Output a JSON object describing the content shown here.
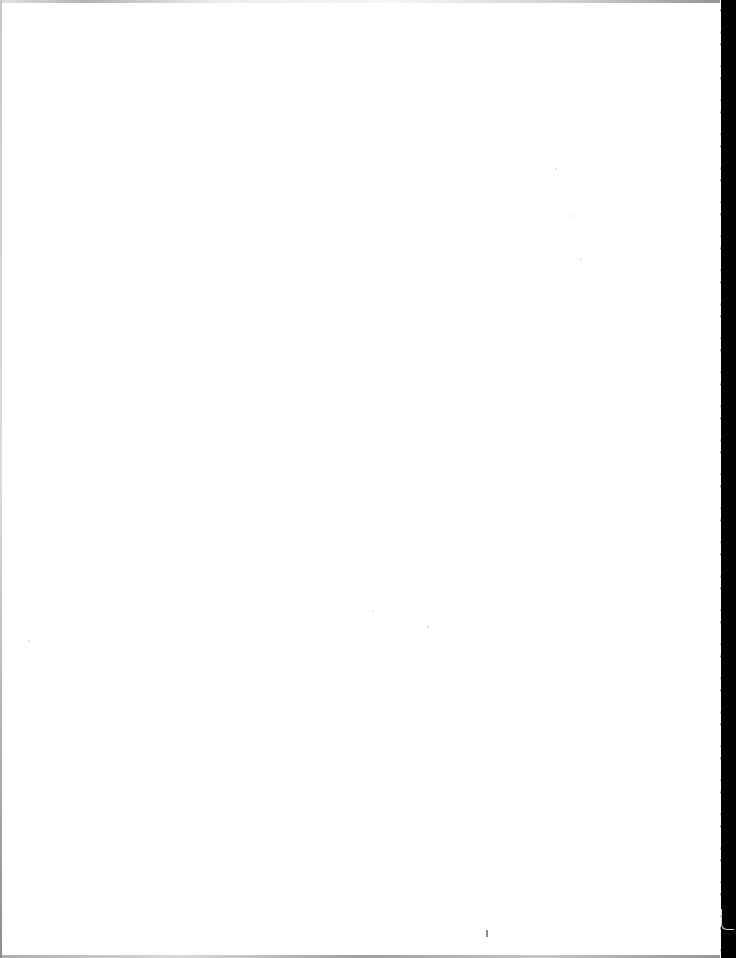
{
  "document": {
    "type": "scanned-page",
    "state": "blank",
    "text": "",
    "colors": {
      "paper": "#ffffff",
      "scanner_background": "#000000",
      "edge_shadow": "#8a8a8a"
    }
  }
}
